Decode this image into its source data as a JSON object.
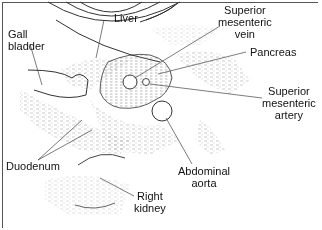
{
  "diagram": {
    "type": "ultrasound-anatomy-sketch",
    "labels": {
      "liver": "Liver",
      "gall_bladder": [
        "Gall",
        "bladder"
      ],
      "superior_mesenteric_vein": [
        "Superior",
        "mesenteric",
        "vein"
      ],
      "pancreas": "Pancreas",
      "superior_mesenteric_artery": [
        "Superior",
        "mesenteric",
        "artery"
      ],
      "duodenum": "Duodenum",
      "abdominal_aorta": [
        "Abdominal",
        "aorta"
      ],
      "right_kidney": [
        "Right",
        "kidney"
      ]
    }
  }
}
